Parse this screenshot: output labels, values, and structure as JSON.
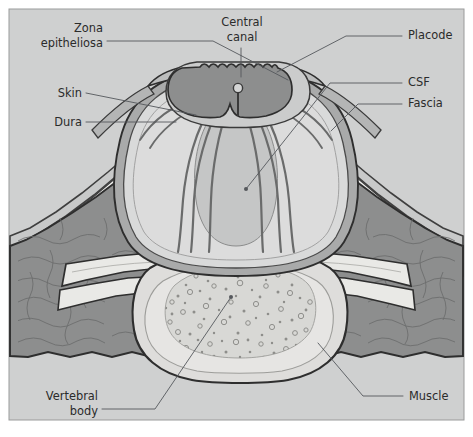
{
  "figure": {
    "panel_background": "#cfd0d0",
    "outer_background": "#ffffff",
    "border_color": "#9a9b9b"
  },
  "palette": {
    "background": "#cfd0d0",
    "placode": "#8d8e8e",
    "placode_outline": "#3a3a3a",
    "csf_sac": "#d4d5d5",
    "sac_fill": "#c2c3c3",
    "dura_band": "#a9aaaa",
    "muscle": "#8d8e8e",
    "muscle_outline": "#2e2e2e",
    "fat": "#f2f2f0",
    "bone": "#e9e9e6",
    "vertebral_body": "#dedddb",
    "marrow": "#d8d8d5",
    "skin_line": "#4a4a4a",
    "leader_line": "#55585c",
    "text": "#2b2b2b"
  },
  "labels": [
    {
      "id": "zona-epitheliosa",
      "line1": "Zona",
      "line2": "epitheliosa",
      "anchor": "end",
      "tx": 103,
      "ty": 32,
      "ty2": 47
    },
    {
      "id": "central-canal",
      "line1": "Central",
      "line2": "canal",
      "anchor": "middle",
      "tx": 242,
      "ty": 26,
      "ty2": 41
    },
    {
      "id": "placode",
      "line1": "Placode",
      "line2": "",
      "anchor": "start",
      "tx": 408,
      "ty": 39,
      "ty2": 0
    },
    {
      "id": "skin",
      "line1": "Skin",
      "line2": "",
      "anchor": "end",
      "tx": 82,
      "ty": 97,
      "ty2": 0
    },
    {
      "id": "csf",
      "line1": "CSF",
      "line2": "",
      "anchor": "start",
      "tx": 408,
      "ty": 86,
      "ty2": 0
    },
    {
      "id": "fascia",
      "line1": "Fascia",
      "line2": "",
      "anchor": "start",
      "tx": 408,
      "ty": 107,
      "ty2": 0
    },
    {
      "id": "dura",
      "line1": "Dura",
      "line2": "",
      "anchor": "end",
      "tx": 82,
      "ty": 126,
      "ty2": 0
    },
    {
      "id": "vertebral-body",
      "line1": "Vertebral",
      "line2": "body",
      "anchor": "end",
      "tx": 98,
      "ty": 400,
      "ty2": 415
    },
    {
      "id": "muscle",
      "line1": "Muscle",
      "line2": "",
      "anchor": "start",
      "tx": 409,
      "ty": 400,
      "ty2": 0
    }
  ],
  "structures": [
    {
      "id": "placode",
      "name": "Neural placode"
    },
    {
      "id": "central-canal",
      "name": "Central canal"
    },
    {
      "id": "csf-sac",
      "name": "CSF-filled sac"
    },
    {
      "id": "nerve-roots",
      "name": "Nerve roots"
    },
    {
      "id": "dura",
      "name": "Dura mater"
    },
    {
      "id": "zona-epitheliosa",
      "name": "Zona epitheliosa"
    },
    {
      "id": "skin",
      "name": "Skin"
    },
    {
      "id": "subcutaneous-fat",
      "name": "Subcutaneous fat"
    },
    {
      "id": "fascia",
      "name": "Fascia"
    },
    {
      "id": "muscle-left",
      "name": "Paraspinal muscle (left)"
    },
    {
      "id": "muscle-right",
      "name": "Paraspinal muscle (right)"
    },
    {
      "id": "lamina-left",
      "name": "Vertebral lamina (left)"
    },
    {
      "id": "lamina-right",
      "name": "Vertebral lamina (right)"
    },
    {
      "id": "vertebral-body",
      "name": "Vertebral body"
    },
    {
      "id": "marrow",
      "name": "Cancellous bone / marrow"
    }
  ]
}
